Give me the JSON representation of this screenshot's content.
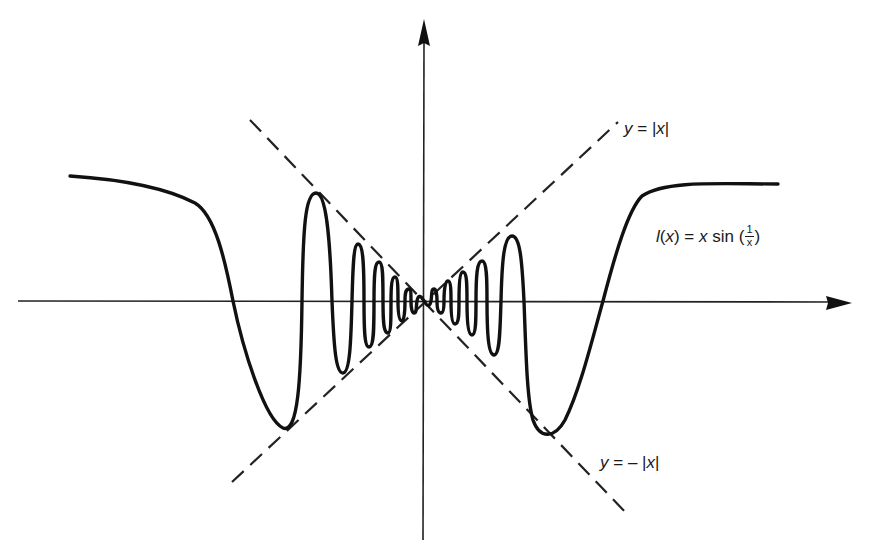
{
  "diagram": {
    "type": "function-graph",
    "axes": {
      "x_axis": {
        "arrow": "right"
      },
      "y_axis": {
        "arrow": "up"
      },
      "origin_px": [
        424,
        301
      ]
    },
    "labels": {
      "upper_bound": {
        "y": "y",
        "eq": "=",
        "rhs_open": "|",
        "rhs_var": "x",
        "rhs_close": "|"
      },
      "lower_bound": {
        "y": "y",
        "eq": "=",
        "minus": "–",
        "rhs_open": "|",
        "rhs_var": "x",
        "rhs_close": "|"
      },
      "function": {
        "name": "l",
        "paren_open": "(",
        "arg": "x",
        "paren_close": ")",
        "eq": "=",
        "var": "x",
        "func": "sin",
        "frac_open": "(",
        "frac_num": "1",
        "frac_den": "x",
        "frac_close": ")"
      }
    },
    "curves": [
      {
        "name": "l(x) = x sin(1/x)",
        "style": "solid",
        "color": "#111111"
      },
      {
        "name": "y = |x|",
        "style": "dashed",
        "color": "#222222"
      },
      {
        "name": "y = -|x|",
        "style": "dashed",
        "color": "#222222"
      }
    ]
  }
}
